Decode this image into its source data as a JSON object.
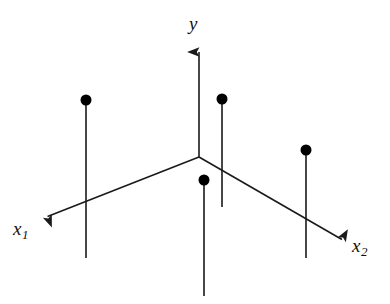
{
  "figure": {
    "kind": "coordinate-axes-diagram",
    "background_color": "#ffffff",
    "stroke_color": "#1a1a1a",
    "dot_color": "#000000",
    "width": 390,
    "height": 304,
    "axes": [
      {
        "name": "y-axis",
        "label": "y",
        "subscript": "",
        "label_position": {
          "x": 189,
          "y": 14
        },
        "start": {
          "x": 199,
          "y": 157
        },
        "end": {
          "x": 199,
          "y": 45
        },
        "arrow": true
      },
      {
        "name": "x1-axis",
        "label": "x",
        "subscript": "1",
        "label_position": {
          "x": 13,
          "y": 219
        },
        "start": {
          "x": 199,
          "y": 157
        },
        "end": {
          "x": 41,
          "y": 219
        },
        "arrow": true
      },
      {
        "name": "x2-axis",
        "label": "x",
        "subscript": "2",
        "label_position": {
          "x": 352,
          "y": 236
        },
        "start": {
          "x": 199,
          "y": 157
        },
        "end": {
          "x": 348,
          "y": 243
        },
        "arrow": true
      }
    ],
    "origin": {
      "x": 199,
      "y": 157
    },
    "stems": [
      {
        "name": "stem-left",
        "x": 86,
        "dot_y": 100,
        "bottom_y": 258
      },
      {
        "name": "stem-center-back",
        "x": 222,
        "dot_y": 99,
        "bottom_y": 207
      },
      {
        "name": "stem-center-front",
        "x": 204,
        "dot_y": 180,
        "bottom_y": 296
      },
      {
        "name": "stem-right",
        "x": 306,
        "dot_y": 150,
        "bottom_y": 258
      }
    ],
    "dot_radius": 5.5,
    "line_width": 1.6
  },
  "chart_data": {
    "type": "scatter",
    "title": "",
    "xlabel": "",
    "ylabel": "",
    "axis_labels": [
      "x₁",
      "y",
      "x₂"
    ],
    "points": [
      {
        "label": "point-1",
        "px": 86,
        "py": 100
      },
      {
        "label": "point-2",
        "px": 222,
        "py": 99
      },
      {
        "label": "point-3",
        "px": 204,
        "py": 180
      },
      {
        "label": "point-4",
        "px": 306,
        "py": 150
      }
    ],
    "grid": false,
    "legend": "none"
  },
  "labels": {
    "y": "y",
    "x": "x",
    "sub1": "1",
    "sub2": "2"
  }
}
